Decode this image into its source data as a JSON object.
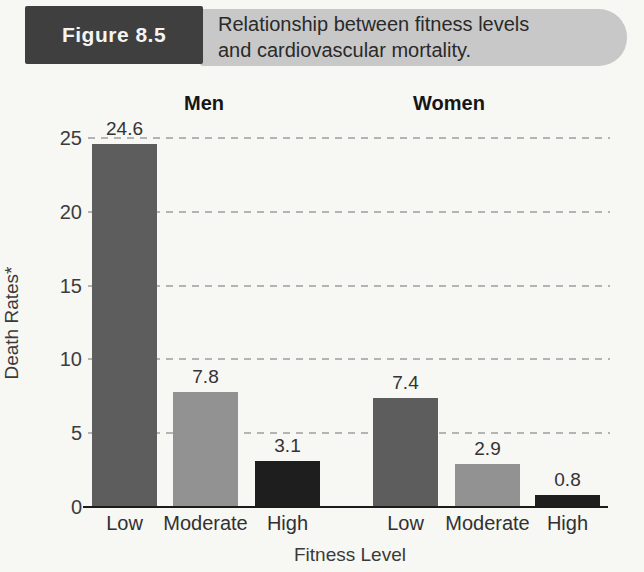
{
  "header": {
    "figure_label": "Figure 8.5",
    "caption_line1": "Relationship between fitness levels",
    "caption_line2": "and cardiovascular mortality."
  },
  "colors": {
    "figure_box": "#3f3f3f",
    "caption_box": "#c8c8c8",
    "bar_low": "#5d5d5d",
    "bar_moderate": "#929292",
    "bar_high": "#1e1e1e",
    "gridline": "#b4b4b4",
    "axis_line": "#1b1b1b"
  },
  "chart_data": {
    "type": "bar",
    "title": "Relationship between fitness levels and cardiovascular mortality.",
    "xlabel": "Fitness Level",
    "ylabel": "Death Rates*",
    "yticks": [
      0,
      5,
      10,
      15,
      20,
      25
    ],
    "ylim": [
      0,
      26
    ],
    "grid": "dashed horizontal",
    "legend": "none",
    "categories": [
      "Low",
      "Moderate",
      "High"
    ],
    "groups": [
      {
        "name": "Men",
        "categories": [
          "Low",
          "Moderate",
          "High"
        ],
        "values": [
          24.6,
          7.8,
          3.1
        ]
      },
      {
        "name": "Women",
        "categories": [
          "Low",
          "Moderate",
          "High"
        ],
        "values": [
          7.4,
          2.9,
          0.8
        ]
      }
    ],
    "bar_colors_by_category": {
      "Low": "#5d5d5d",
      "Moderate": "#929292",
      "High": "#1e1e1e"
    }
  }
}
